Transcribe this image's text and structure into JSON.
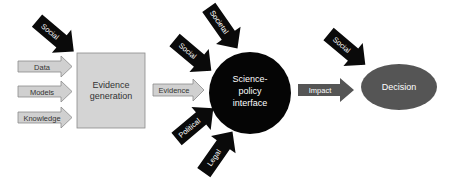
{
  "colors": {
    "input_arrow_fill": "#d0d0d0",
    "input_arrow_stroke": "#8a8a8a",
    "influence_arrow_fill": "#0a0a0a",
    "evidence_box_fill": "#d4d4d4",
    "evidence_box_stroke": "#8a8a8a",
    "interface_circle_fill": "#050505",
    "impact_arrow_fill": "#555555",
    "decision_ellipse_fill": "#555555"
  },
  "nodes": {
    "evidence_generation": {
      "line1": "Evidence",
      "line2": "generation"
    },
    "science_policy_interface": {
      "line1": "Science-",
      "line2": "policy",
      "line3": "interface"
    },
    "decision": {
      "label": "Decision"
    }
  },
  "inputs": {
    "data": "Data",
    "models": "Models",
    "knowledge": "Knowledge"
  },
  "flows": {
    "evidence": "Evidence",
    "impact": "Impact"
  },
  "influences": {
    "evidence_social": "Social",
    "interface_societal": "Societal",
    "interface_social": "Social",
    "interface_political": "Political",
    "interface_legal": "Legal",
    "decision_social": "Social"
  }
}
